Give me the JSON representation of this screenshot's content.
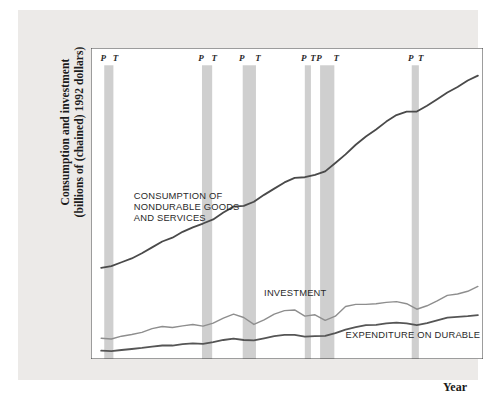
{
  "chart_data": {
    "type": "line",
    "title": "",
    "xlabel": "Year",
    "ylabel": "Consumption and investment (billions of (chained) 1992 dollars)",
    "ylabel_line1": "Consumption and investment",
    "ylabel_line2": "(billions of (chained) 1992 dollars)",
    "xlim": [
      1959.0,
      1997.5
    ],
    "ylim": [
      0,
      4500
    ],
    "yticks": [
      0,
      500,
      1000,
      1500,
      2000,
      2500,
      3000,
      3500,
      4000,
      4500
    ],
    "xticks": [
      1960,
      1965,
      1970,
      1975,
      1980,
      1985,
      1990,
      1995
    ],
    "grid": false,
    "legend_position": "inline-annotations",
    "colors": {
      "consumption": "#4a4a4a",
      "investment": "#8e8e8e",
      "durables": "#555555",
      "recession_band": "#cfcfcf",
      "figure_background": "#eceae8",
      "plot_background": "#ffffff",
      "axis": "#3a3a3a"
    },
    "annotations": [
      {
        "name": "consumption-label",
        "text_lines": [
          "CONSUMPTION OF",
          "NONDURABLE GOODS",
          "AND SERVICES"
        ],
        "x": 1963.2,
        "y": 2320
      },
      {
        "name": "investment-label",
        "text_lines": [
          "INVESTMENT"
        ],
        "x": 1976.0,
        "y": 905
      },
      {
        "name": "durables-label",
        "text_lines": [
          "EXPENDITURE ON DURABLE GOODS"
        ],
        "x": 1984.0,
        "y": 300
      }
    ],
    "recessions": [
      {
        "peak_label": "P",
        "trough_label": "T",
        "start": 1960.3,
        "end": 1961.2
      },
      {
        "peak_label": "P",
        "trough_label": "T",
        "start": 1969.9,
        "end": 1970.9
      },
      {
        "peak_label": "P",
        "trough_label": "T",
        "start": 1973.9,
        "end": 1975.2
      },
      {
        "peak_label": "P",
        "trough_label": "T",
        "start": 1980.0,
        "end": 1980.6
      },
      {
        "peak_label": "P",
        "trough_label": "T",
        "start": 1981.5,
        "end": 1982.9
      },
      {
        "peak_label": "P",
        "trough_label": "T",
        "start": 1990.5,
        "end": 1991.2
      }
    ],
    "series": [
      {
        "name": "CONSUMPTION OF NONDURABLE GOODS AND SERVICES",
        "color": "#4a4a4a",
        "x": [
          1960,
          1961,
          1962,
          1963,
          1964,
          1965,
          1966,
          1967,
          1968,
          1969,
          1970,
          1971,
          1972,
          1973,
          1974,
          1975,
          1976,
          1977,
          1978,
          1979,
          1980,
          1981,
          1982,
          1983,
          1984,
          1985,
          1986,
          1987,
          1988,
          1989,
          1990,
          1991,
          1992,
          1993,
          1994,
          1995,
          1996,
          1997
        ],
        "values": [
          1320,
          1345,
          1400,
          1455,
          1530,
          1615,
          1700,
          1755,
          1840,
          1905,
          1960,
          2020,
          2120,
          2205,
          2215,
          2275,
          2375,
          2465,
          2555,
          2620,
          2630,
          2665,
          2715,
          2835,
          2960,
          3100,
          3220,
          3320,
          3435,
          3530,
          3580,
          3580,
          3665,
          3760,
          3855,
          3935,
          4030,
          4100
        ]
      },
      {
        "name": "INVESTMENT",
        "color": "#8e8e8e",
        "x": [
          1960,
          1961,
          1962,
          1963,
          1964,
          1965,
          1966,
          1967,
          1968,
          1969,
          1970,
          1971,
          1972,
          1973,
          1974,
          1975,
          1976,
          1977,
          1978,
          1979,
          1980,
          1981,
          1982,
          1983,
          1984,
          1985,
          1986,
          1987,
          1988,
          1989,
          1990,
          1991,
          1992,
          1993,
          1994,
          1995,
          1996,
          1997
        ],
        "values": [
          300,
          290,
          330,
          355,
          385,
          440,
          470,
          455,
          480,
          500,
          475,
          520,
          590,
          650,
          600,
          500,
          565,
          650,
          700,
          710,
          620,
          640,
          560,
          620,
          760,
          790,
          790,
          800,
          820,
          830,
          800,
          720,
          770,
          840,
          920,
          940,
          980,
          1050
        ]
      },
      {
        "name": "EXPENDITURE ON DURABLE GOODS",
        "color": "#555555",
        "x": [
          1960,
          1961,
          1962,
          1963,
          1964,
          1965,
          1966,
          1967,
          1968,
          1969,
          1970,
          1971,
          1972,
          1973,
          1974,
          1975,
          1976,
          1977,
          1978,
          1979,
          1980,
          1981,
          1982,
          1983,
          1984,
          1985,
          1986,
          1987,
          1988,
          1989,
          1990,
          1991,
          1992,
          1993,
          1994,
          1995,
          1996,
          1997
        ],
        "values": [
          120,
          115,
          130,
          145,
          160,
          180,
          195,
          195,
          215,
          225,
          220,
          245,
          275,
          295,
          275,
          270,
          300,
          330,
          350,
          350,
          325,
          330,
          335,
          375,
          425,
          460,
          490,
          495,
          515,
          525,
          515,
          490,
          520,
          560,
          600,
          610,
          620,
          635
        ]
      }
    ]
  }
}
